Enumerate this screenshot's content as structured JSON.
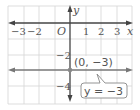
{
  "diagram": {
    "type": "coordinate-plane",
    "x_axis_label": "x",
    "y_axis_label": "y",
    "origin_label": "O",
    "x_ticks": [
      {
        "value": -3,
        "label": "−3"
      },
      {
        "value": -2,
        "label": "−2"
      },
      {
        "value": 1,
        "label": "1"
      },
      {
        "value": 2,
        "label": "2"
      },
      {
        "value": 3,
        "label": "3"
      }
    ],
    "y_ticks": [
      {
        "value": -2,
        "label": "−2"
      },
      {
        "value": -4,
        "label": "−4"
      }
    ],
    "line": {
      "equation": "y = −3",
      "type": "horizontal",
      "y_value": -3
    },
    "point": {
      "x": 0,
      "y": -3,
      "label": "(0, −3)"
    },
    "colors": {
      "grid": "#cfcfcf",
      "axis": "#444444",
      "line": "#777777",
      "text": "#555555",
      "point": "#888888"
    }
  }
}
